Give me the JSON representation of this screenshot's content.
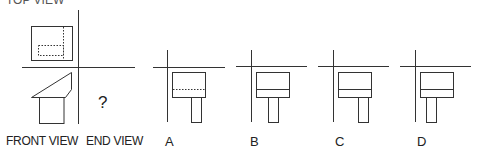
{
  "problem": {
    "top_label": "TOP VIEW",
    "front_label": "FRONT VIEW",
    "end_label": "END VIEW",
    "unknown_mark": "?"
  },
  "options": [
    {
      "letter": "A",
      "middle_line": "dashed",
      "stem_position": "right"
    },
    {
      "letter": "B",
      "middle_line": "solid",
      "stem_position": "center"
    },
    {
      "letter": "C",
      "middle_line": "solid",
      "stem_position": "right"
    },
    {
      "letter": "D",
      "middle_line": "solid",
      "stem_position": "left"
    }
  ],
  "colors": {
    "line": "#333333",
    "background": "#ffffff"
  }
}
